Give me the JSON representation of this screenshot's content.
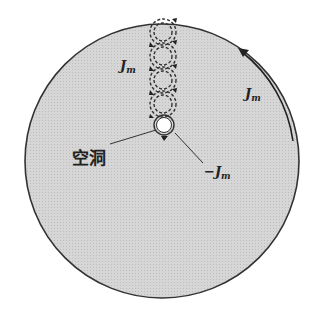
{
  "diagram": {
    "type": "superconductor-magnetization-current-diagram",
    "colors": {
      "disk_fill": "#d4d4d4",
      "outline": "#333333",
      "hole_fill": "#ffffff"
    },
    "labels": {
      "loop_current": {
        "main": "J",
        "sub": "m"
      },
      "surface_current": {
        "main": "J",
        "sub": "m"
      },
      "hole_current": {
        "main": "−J",
        "sub": "m"
      },
      "hole": "空洞"
    },
    "loops": {
      "count": 4
    }
  }
}
